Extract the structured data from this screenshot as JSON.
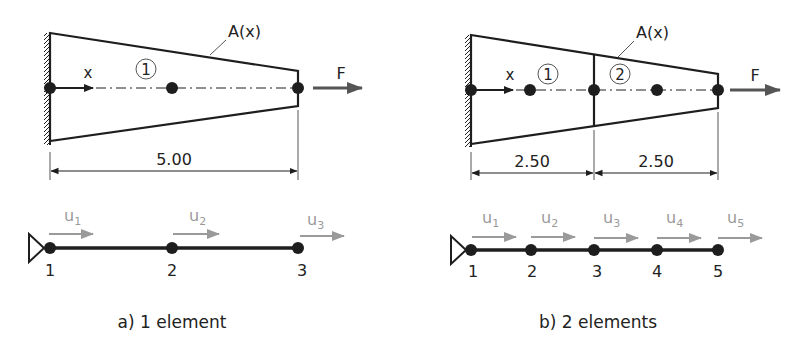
{
  "colors": {
    "ink": "#1e1e1e",
    "dof_arrow": "#9a9a9a",
    "dof_label": "#9a9a9a"
  },
  "panels": [
    {
      "id": "a",
      "caption": "a) 1 element",
      "area_label": "A(x)",
      "axis_label": "x",
      "force_label": "F",
      "elements": [
        "1"
      ],
      "dimensions": [
        "5.00"
      ],
      "nodes": [
        "1",
        "2",
        "3"
      ],
      "dofs": [
        "u1",
        "u2",
        "u3"
      ],
      "dof_base": "u",
      "dof_subs": [
        "1",
        "2",
        "3"
      ]
    },
    {
      "id": "b",
      "caption": "b) 2 elements",
      "area_label": "A(x)",
      "axis_label": "x",
      "force_label": "F",
      "elements": [
        "1",
        "2"
      ],
      "dimensions": [
        "2.50",
        "2.50"
      ],
      "nodes": [
        "1",
        "2",
        "3",
        "4",
        "5"
      ],
      "dofs": [
        "u1",
        "u2",
        "u3",
        "u4",
        "u5"
      ],
      "dof_base": "u",
      "dof_subs": [
        "1",
        "2",
        "3",
        "4",
        "5"
      ]
    }
  ]
}
